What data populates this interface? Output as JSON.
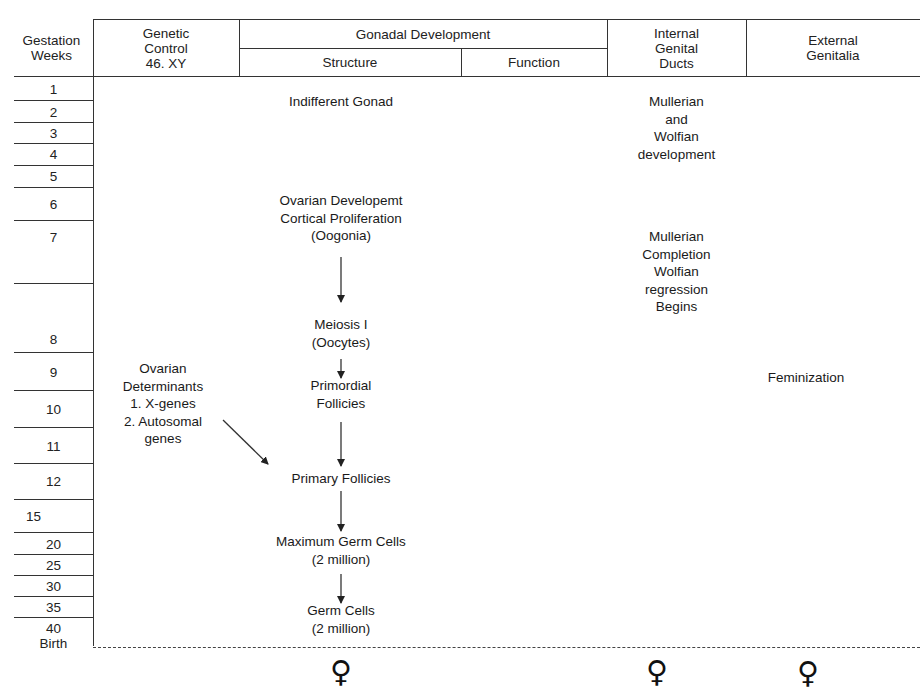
{
  "header": {
    "gestation_weeks": "Gestation\nWeeks",
    "genetic_control": "Genetic\nControl\n46. XY",
    "gonadal_development": "Gonadal Development",
    "structure": "Structure",
    "function": "Function",
    "internal_genital_ducts": "Internal\nGenital\nDucts",
    "external_genitalia": "External\nGenitalia"
  },
  "weeks": [
    {
      "label": "1",
      "top": 77,
      "bottom": 100
    },
    {
      "label": "2",
      "top": 100,
      "bottom": 122
    },
    {
      "label": "3",
      "top": 122,
      "bottom": 143
    },
    {
      "label": "4",
      "top": 143,
      "bottom": 165
    },
    {
      "label": "5",
      "top": 165,
      "bottom": 187
    },
    {
      "label": "6",
      "top": 187,
      "bottom": 220
    },
    {
      "label": "7",
      "top": 220,
      "bottom": 283
    },
    {
      "label": "",
      "top": 283,
      "bottom": 352
    },
    {
      "label": "9",
      "top": 352,
      "bottom": 390
    },
    {
      "label": "10",
      "top": 390,
      "bottom": 427
    },
    {
      "label": "11",
      "top": 427,
      "bottom": 463
    },
    {
      "label": "12",
      "top": 463,
      "bottom": 499
    },
    {
      "label": "15",
      "top": 499,
      "bottom": 532
    },
    {
      "label": "20",
      "top": 532,
      "bottom": 554
    },
    {
      "label": "25",
      "top": 554,
      "bottom": 575
    },
    {
      "label": "30",
      "top": 575,
      "bottom": 596
    },
    {
      "label": "35",
      "top": 596,
      "bottom": 617
    }
  ],
  "week_labels": {
    "w1": "1",
    "w2": "2",
    "w3": "3",
    "w4": "4",
    "w5": "5",
    "w6": "6",
    "w7": "7",
    "w8": "8",
    "w9": "9",
    "w10": "10",
    "w11": "11",
    "w12": "12",
    "w15": "15",
    "w20": "20",
    "w25": "25",
    "w30": "30",
    "w35": "35",
    "w40_birth": "40\nBirth"
  },
  "genetic_control": {
    "ovarian_determinants": "Ovarian\nDeterminants\n1. X-genes\n2. Autosomal\ngenes"
  },
  "structure": {
    "indifferent_gonad": "Indifferent Gonad",
    "ovarian_development": "Ovarian Developemt\nCortical Proliferation\n(Oogonia)",
    "meiosis": "Meiosis I\n(Oocytes)",
    "primordial_follicles": "Primordial\nFollicies",
    "primary_follicles": "Primary Follicies",
    "maximum_germ_cells": "Maximum Germ Cells\n(2 million)",
    "germ_cells": "Germ Cells\n(2 million)"
  },
  "internal_ducts": {
    "development": "Mullerian\nand\nWolfian\ndevelopment",
    "completion": "Mullerian\nCompletion\nWolfian\nregression\nBegins"
  },
  "external_genitalia": {
    "feminization": "Feminization"
  },
  "outcome_symbols": {
    "gonad": "♀",
    "ducts": "♀",
    "genitalia": "♀",
    "icon": "female-symbol-icon"
  },
  "colors": {
    "line": "#333333",
    "text": "#1a1a1a",
    "background": "#ffffff"
  }
}
